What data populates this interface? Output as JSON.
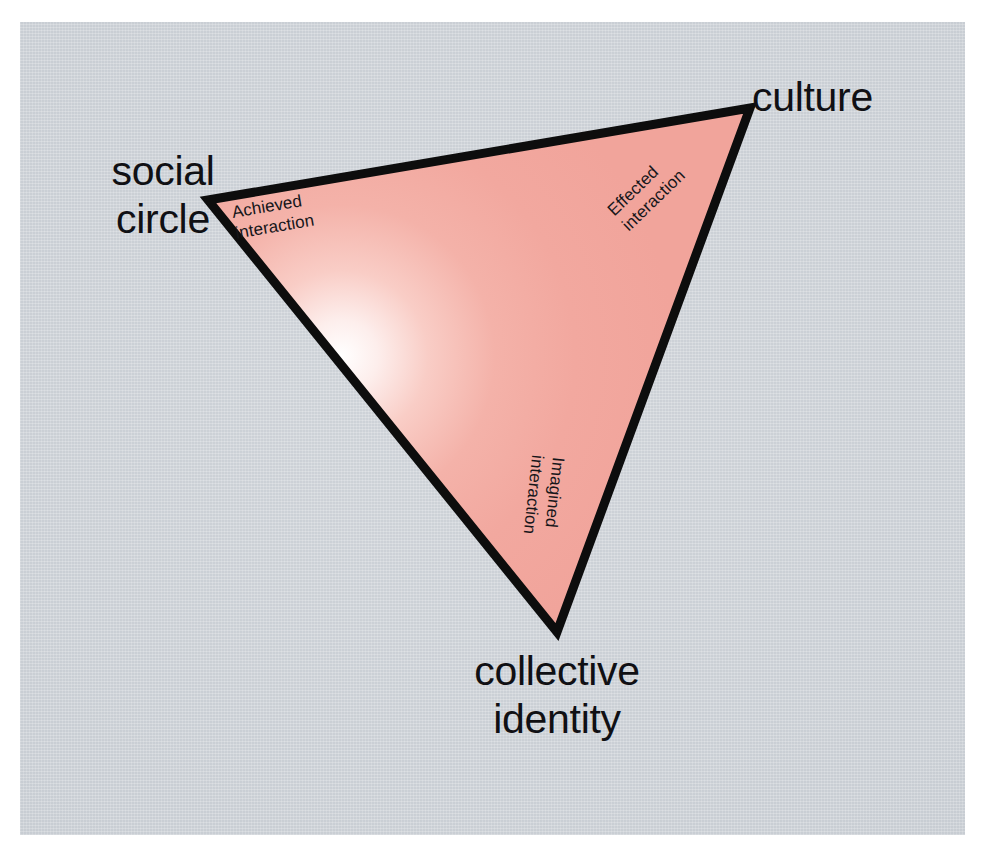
{
  "figure": {
    "background_color": "#ffffff",
    "panel_color": "#c9ced4",
    "shape": {
      "name": "triangle",
      "fill_color": "#f2a79e",
      "highlight_color": "#ffffff",
      "stroke_color": "#0d0d0d",
      "stroke_width": 9,
      "vertices": [
        {
          "id": "social-circle",
          "x": 208,
          "y": 200
        },
        {
          "id": "culture",
          "x": 750,
          "y": 108
        },
        {
          "id": "collective-identity",
          "x": 557,
          "y": 632
        }
      ]
    }
  },
  "vertex_labels": {
    "social_circle": {
      "id": "social-circle",
      "lines": [
        "social",
        "circle"
      ],
      "line1": "social",
      "line2": "circle"
    },
    "culture": {
      "id": "culture",
      "lines": [
        "culture"
      ],
      "line1": "culture"
    },
    "collective_identity": {
      "id": "collective-identity",
      "lines": [
        "collective",
        "identity"
      ],
      "line1": "collective",
      "line2": "identity"
    }
  },
  "edge_labels": {
    "achieved_interaction": {
      "id": "achieved-interaction",
      "between": [
        "social-circle",
        "culture"
      ],
      "line1": "Achieved",
      "line2": "interaction",
      "rotation_deg": -9.6
    },
    "effected_interaction": {
      "id": "effected-interaction",
      "between": [
        "culture",
        "collective-identity"
      ],
      "line1": "Effected",
      "line2": "interaction",
      "rotation_deg": -44
    },
    "imagined_interaction": {
      "id": "imagined-interaction",
      "between": [
        "collective-identity",
        "social-circle"
      ],
      "line1": "Imagined",
      "line2": "interaction",
      "rotation_deg": 96
    }
  }
}
